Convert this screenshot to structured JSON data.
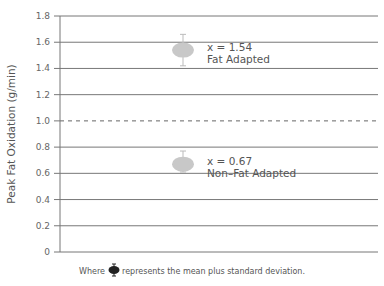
{
  "chart_data": {
    "type": "scatter",
    "title": "",
    "xlabel": "",
    "ylabel": "Peak Fat Oxidation (g/min)",
    "ylim": [
      0,
      1.8
    ],
    "yticks": [
      "0",
      "0.2",
      "0.4",
      "0.6",
      "0.8",
      "1.0",
      "1.2",
      "1.4",
      "1.6",
      "1.8"
    ],
    "grid": true,
    "reference_line": {
      "y": 1.0,
      "style": "dashed"
    },
    "series": [
      {
        "name": "Fat Adapted",
        "mean": 1.54,
        "sd_low": 1.42,
        "sd_high": 1.66,
        "label": "x = 1.54"
      },
      {
        "name": "Non–Fat Adapted",
        "mean": 0.67,
        "sd_low": 0.61,
        "sd_high": 0.77,
        "label": "x = 0.67"
      }
    ],
    "marker_color": "#c8c8c8",
    "footnote": {
      "before": "Where",
      "after": "represents the mean plus standard deviation."
    }
  }
}
